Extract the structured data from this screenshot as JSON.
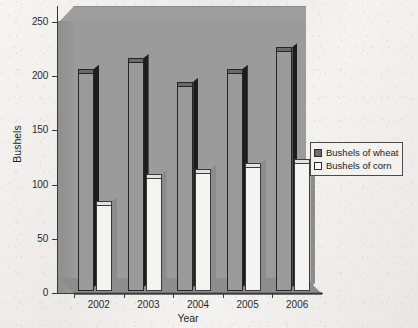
{
  "chart_data": {
    "type": "bar",
    "title": "",
    "subtitle": "",
    "xlabel": "Year",
    "ylabel": "Bushels",
    "categories": [
      "2002",
      "2003",
      "2004",
      "2005",
      "2006"
    ],
    "series": [
      {
        "name": "Bushels of wheat",
        "values": [
          205,
          215,
          193,
          205,
          225
        ],
        "color": "#9a9a9a"
      },
      {
        "name": "Bushels of corn",
        "values": [
          83,
          108,
          113,
          118,
          122
        ],
        "color": "#f4f4f2"
      }
    ],
    "ylim": [
      0,
      250
    ],
    "yticks": [
      0,
      50,
      100,
      150,
      200,
      250
    ],
    "ytick_labels": [
      "0",
      "50",
      "100",
      "150",
      "200",
      "250"
    ],
    "grid": false,
    "legend_position": "right",
    "style": "3d-column",
    "plot_background_color": "#9b9b9b",
    "page_background_color": "#efeeea"
  },
  "axes": {
    "y_title": "Bushels",
    "x_title": "Year",
    "y_tick_labels": [
      "250",
      "200",
      "150",
      "100",
      "50",
      "0"
    ],
    "x_tick_labels": [
      "2002",
      "2003",
      "2004",
      "2005",
      "2006"
    ]
  },
  "legend": {
    "items": [
      {
        "label": "Bushels of wheat",
        "swatch": "dark-gray-square"
      },
      {
        "label": "Bushels of corn",
        "swatch": "white-square"
      }
    ]
  }
}
